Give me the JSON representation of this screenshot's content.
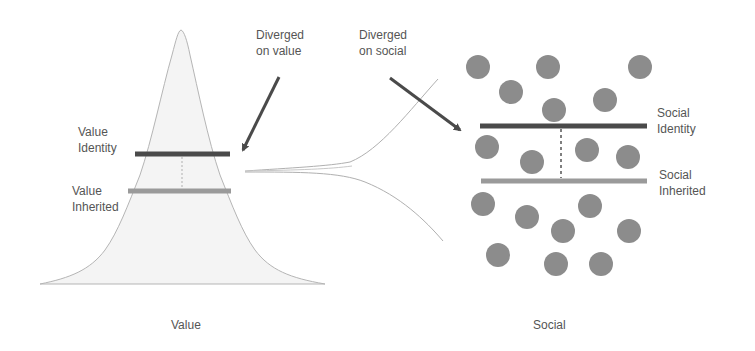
{
  "diagram": {
    "left_panel": {
      "caption": "Value",
      "labels": {
        "identity": [
          "Value",
          "Identity"
        ],
        "inherited": [
          "Value",
          "Inherited"
        ]
      }
    },
    "right_panel": {
      "caption": "Social",
      "labels": {
        "identity": [
          "Social",
          "Identity"
        ],
        "inherited": [
          "Social",
          "Inherited"
        ]
      }
    },
    "annotations": {
      "diverged_value": [
        "Diverged",
        "on value"
      ],
      "diverged_social": [
        "Diverged",
        "on social"
      ]
    },
    "colors": {
      "identity_line": "#4a4a4a",
      "inherited_line": "#9a9a9a",
      "circle": "#8c8c8c",
      "arrow": "#4a4a4a",
      "curve": "#b0b0b0",
      "bell_fill": "#f4f4f4"
    }
  }
}
